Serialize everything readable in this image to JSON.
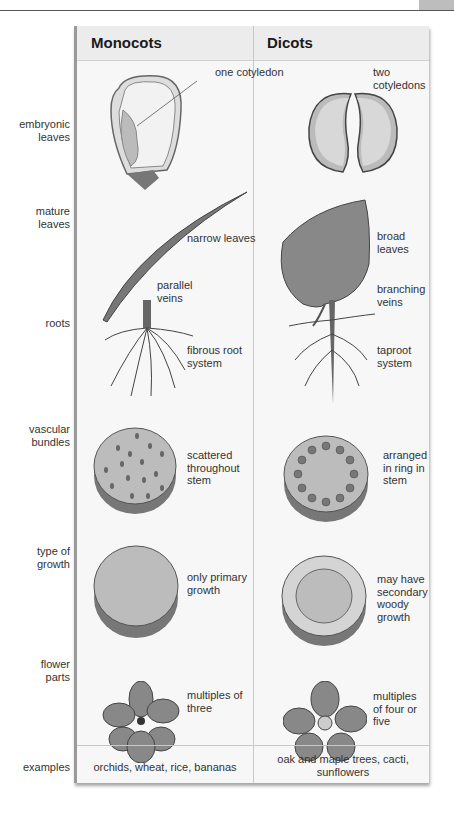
{
  "columns": {
    "monocots": "Monocots",
    "dicots": "Dicots"
  },
  "rows": [
    {
      "label": "embryonic leaves",
      "monocot_note": "one cotyledon",
      "dicot_note": "two cotyledons"
    },
    {
      "label": "mature leaves",
      "monocot_note": "narrow leaves",
      "monocot_note2": "parallel veins",
      "dicot_note": "broad leaves",
      "dicot_note2": "branching veins"
    },
    {
      "label": "roots",
      "monocot_note": "fibrous root system",
      "dicot_note": "taproot system"
    },
    {
      "label": "vascular bundles",
      "monocot_note": "scattered throughout stem",
      "dicot_note": "arranged in ring in stem"
    },
    {
      "label": "type of growth",
      "monocot_note": "only primary growth",
      "dicot_note": "may have secondary woody growth"
    },
    {
      "label": "flower parts",
      "monocot_note": "multiples of three",
      "dicot_note": "multiples of four or five"
    },
    {
      "label": "examples",
      "monocot_note": "orchids, wheat, rice, bananas",
      "dicot_note": "oak and maple trees, cacti, sunflowers"
    }
  ],
  "labels_split": {
    "r0": [
      "embryonic",
      "leaves"
    ],
    "r1": [
      "mature",
      "leaves"
    ],
    "r3": [
      "vascular",
      "bundles"
    ],
    "r4": [
      "type of",
      "growth"
    ],
    "r5": [
      "flower",
      "parts"
    ]
  }
}
